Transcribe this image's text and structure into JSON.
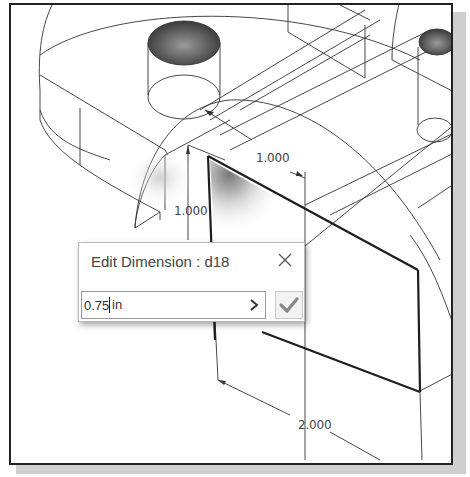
{
  "viewport": {
    "name": "3D model graphics area",
    "dimensions": [
      {
        "id": "dim-top",
        "value": "1.000",
        "x": 245,
        "y": 146
      },
      {
        "id": "dim-left",
        "value": "1.000",
        "x": 171,
        "y": 202
      },
      {
        "id": "dim-bottom",
        "value": "2.000",
        "x": 294,
        "y": 416
      }
    ],
    "highlight_color": "#222222",
    "hole_shade_color": "#555555"
  },
  "dialog": {
    "title": "Edit Dimension : d18",
    "close_icon": "close-icon",
    "input_value": "0.75",
    "unit": "in",
    "expand_icon": "chevron-right-icon",
    "accept_icon": "checkmark-icon",
    "accept_color": "#888888"
  }
}
